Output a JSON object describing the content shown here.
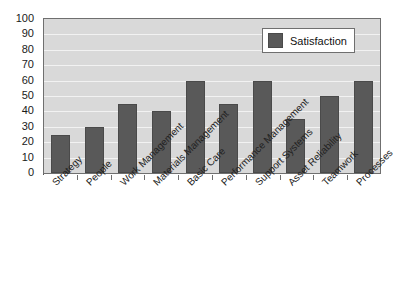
{
  "chart_data": {
    "type": "bar",
    "title": "",
    "subtitle": "",
    "xlabel": "",
    "ylabel": "",
    "categories": [
      "Strategy",
      "People",
      "Work Management",
      "Materials Management",
      "Basic Care",
      "Performance Management",
      "Support Systems",
      "Asset Reliability",
      "Teamwork",
      "Processes"
    ],
    "series": [
      {
        "name": "Satisfaction",
        "color": "#595959",
        "values": [
          25,
          30,
          45,
          40,
          60,
          45,
          60,
          35,
          50,
          60
        ]
      }
    ],
    "ylim": [
      0,
      100
    ],
    "ytick_step": 10,
    "yticks": [
      100,
      90,
      80,
      70,
      60,
      50,
      40,
      30,
      20,
      10,
      0
    ],
    "grid": true,
    "grid_axis": "y",
    "legend_position": "top-right",
    "plot_background": "#d9d9d9",
    "grid_color": "#f2f2f2",
    "axis_color": "#6f6f6f",
    "figure_background": "#ffffff"
  },
  "legend": {
    "entries": [
      {
        "label": "Satisfaction",
        "color": "#595959"
      }
    ]
  }
}
